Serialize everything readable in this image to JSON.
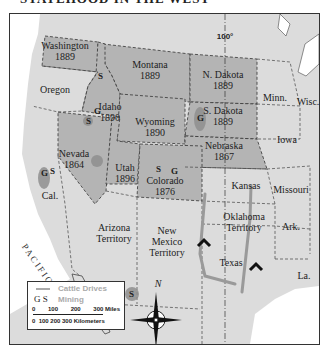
{
  "title": "STATEHOOD IN THE WEST",
  "meridian_label": "100°",
  "states": [
    {
      "name": "Washington",
      "year": "1889"
    },
    {
      "name": "Montana",
      "year": "1889"
    },
    {
      "name": "N. Dakota",
      "year": "1889"
    },
    {
      "name": "S. Dakota",
      "year": "1889"
    },
    {
      "name": "Idaho",
      "year": "1890"
    },
    {
      "name": "Wyoming",
      "year": "1890"
    },
    {
      "name": "Nebraska",
      "year": "1867"
    },
    {
      "name": "Nevada",
      "year": "1864"
    },
    {
      "name": "Utah",
      "year": "1896"
    },
    {
      "name": "Colorado",
      "year": "1876"
    }
  ],
  "other_regions": [
    "Oregon",
    "Minn.",
    "Wisc.",
    "Iowa",
    "Cal.",
    "Kansas",
    "Missouri",
    "Arizona Territory",
    "New Mexico Territory",
    "Oklahoma Territory",
    "Ark.",
    "Texas",
    "La."
  ],
  "ocean": "PACIFIC OCEAN",
  "mining_markers": [
    "S",
    "G",
    "S",
    "G",
    "S",
    "G",
    "S",
    "G",
    "S"
  ],
  "legend": {
    "cattle_label": "Cattle Drives",
    "mining_symbols": "G  S",
    "mining_label": "Mining",
    "miles_ticks": [
      "0",
      "100",
      "200",
      "300 Miles"
    ],
    "km_label": "0  100 200 300 Kilometers"
  },
  "compass": {
    "north": "N"
  },
  "colors": {
    "highlighted_state": "#b4b4b4",
    "other_land": "#dcdcdc",
    "water": "#ffffff",
    "cattle_drive": "#9a9a9a",
    "mining_area": "#8f8f8f"
  }
}
